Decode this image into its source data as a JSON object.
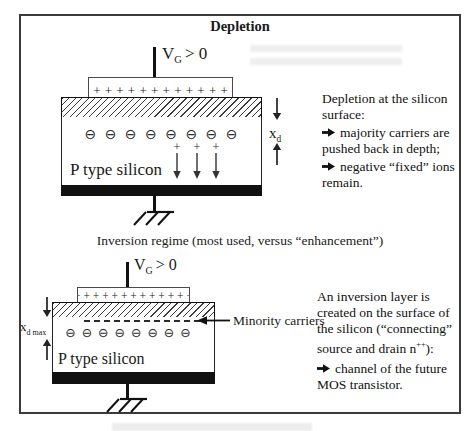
{
  "frame": {
    "title": "Depletion"
  },
  "captions": {
    "middle": "Inversion regime (most used, versus “enhancement”)"
  },
  "depletion_diagram": {
    "gate_voltage": {
      "main": "V",
      "sub": "G",
      "rest": "> 0"
    },
    "gate_charges": "+ + + + + + + + + + + + + +",
    "ion_charges": "⊖ ⊖ ⊖ ⊖ ⊖ ⊖ ⊖ ⊖",
    "field_charge": "+",
    "body_label": "P type silicon",
    "depth_label": {
      "main": "x",
      "sub": "d"
    }
  },
  "depletion_note": {
    "line1": "Depletion at the silicon",
    "line2": "surface:",
    "bullet1": "majority carriers are",
    "line3": "pushed back in depth;",
    "bullet2": "negative “fixed” ions",
    "line4": "remain."
  },
  "inversion_diagram": {
    "gate_voltage": {
      "main": "V",
      "sub": "G",
      "rest": "> 0"
    },
    "gate_charges": "+ + + + + + + + + + + + +",
    "electron_charges": "⊖ ⊖ ⊖ ⊖ ⊖ ⊖ ⊖ ⊖",
    "body_label": "P type silicon",
    "depth_label": {
      "main": "x",
      "sub": "d max"
    },
    "carriers_label": "Minority carriers"
  },
  "inversion_note": {
    "line1": "An inversion layer is",
    "line2": "created on the surface of",
    "line3": "the silicon (“connecting”",
    "line4_pre": "source and drain n",
    "line4_sup": "++",
    "line4_post": "):",
    "bullet1": "channel of the future",
    "line5": "MOS transistor."
  },
  "colors": {
    "ink": "#1a1a1a",
    "substrate": "#111111"
  }
}
